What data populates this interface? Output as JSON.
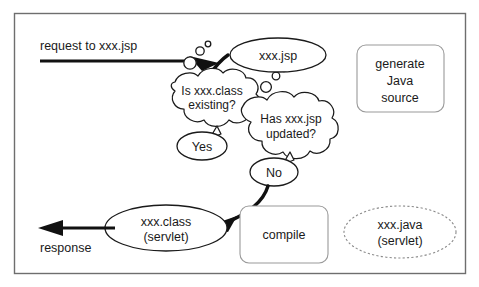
{
  "diagram": {
    "frame": {
      "name": "diagram-border"
    },
    "colors": {
      "stroke": "#1a1a1a",
      "faint_stroke": "#9a9a9a",
      "dashed_stroke": "#8a8a8a",
      "frame": "#6e6e6e",
      "background": "#ffffff",
      "text": "#1a1a1a"
    },
    "labels": {
      "request": "request to xxx.jsp",
      "response": "response"
    },
    "nodes": [
      {
        "id": "xxx-jsp",
        "shape": "ellipse",
        "style": "solid",
        "lines": [
          "xxx.jsp"
        ]
      },
      {
        "id": "is-xxx-class-existing",
        "shape": "thought-cloud",
        "style": "solid",
        "lines": [
          "Is xxx.class",
          "existing?"
        ]
      },
      {
        "id": "has-xxx-jsp-updated",
        "shape": "thought-cloud",
        "style": "solid",
        "lines": [
          "Has xxx.jsp",
          "updated?"
        ]
      },
      {
        "id": "yes-answer",
        "shape": "callout-ellipse",
        "style": "solid",
        "lines": [
          "Yes"
        ]
      },
      {
        "id": "no-answer",
        "shape": "callout-ellipse",
        "style": "solid",
        "lines": [
          "No"
        ]
      },
      {
        "id": "generate-java-source",
        "shape": "rounded-rect",
        "style": "faint",
        "lines": [
          "generate",
          "Java",
          "source"
        ]
      },
      {
        "id": "xxx-class-servlet",
        "shape": "ellipse",
        "style": "solid",
        "lines": [
          "xxx.class",
          "(servlet)"
        ]
      },
      {
        "id": "compile",
        "shape": "rounded-rect",
        "style": "faint",
        "lines": [
          "compile"
        ]
      },
      {
        "id": "xxx-java-servlet",
        "shape": "ellipse",
        "style": "dashed",
        "lines": [
          "xxx.java",
          "(servlet)"
        ]
      }
    ],
    "edges": [
      {
        "id": "request-arrow",
        "from": "request-entry",
        "to": "is-xxx-class-existing",
        "style": "straight-thick"
      },
      {
        "id": "jsp-to-class-arrow",
        "from": "xxx-jsp",
        "to": "request-point",
        "style": "curved-thick"
      },
      {
        "id": "no-to-class-arrow",
        "from": "no-answer",
        "to": "xxx-class-servlet",
        "style": "curved-thick"
      },
      {
        "id": "response-arrow",
        "from": "xxx-class-servlet",
        "to": "response-exit",
        "style": "straight-thick"
      }
    ]
  }
}
